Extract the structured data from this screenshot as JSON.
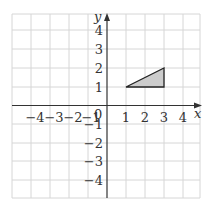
{
  "diagram": {
    "type": "coordinate-grid",
    "x_axis_label": "x",
    "y_axis_label": "y",
    "origin_label": "0",
    "x_ticks": [
      "−4",
      "−3",
      "−2",
      "−1",
      "1",
      "2",
      "3",
      "4"
    ],
    "y_ticks": [
      "4",
      "3",
      "2",
      "1",
      "−1",
      "−2",
      "−3",
      "−4"
    ],
    "range": {
      "x": [
        -5,
        5
      ],
      "y": [
        -5,
        5
      ]
    },
    "shape": {
      "type": "triangle",
      "vertices": [
        [
          1,
          1
        ],
        [
          3,
          1
        ],
        [
          3,
          2
        ]
      ],
      "fill": "#cccccc",
      "stroke": "#222222"
    },
    "colors": {
      "grid": "#d6d6d6",
      "axis": "#333333"
    }
  }
}
